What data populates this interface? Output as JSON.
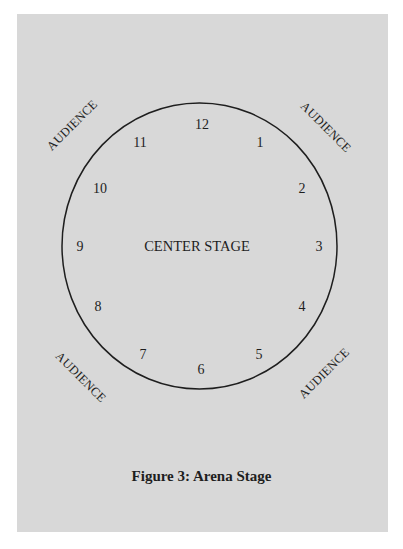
{
  "figure": {
    "caption": "Figure 3: Arena Stage",
    "center_label": "CENTER STAGE",
    "audience_label": "AUDIENCE",
    "colors": {
      "page_background": "#ffffff",
      "panel_background": "#d8d8d8",
      "ink": "#1e1e1e"
    },
    "positions": [
      {
        "label": "12",
        "x": 202,
        "y": 129
      },
      {
        "label": "1",
        "x": 260,
        "y": 147
      },
      {
        "label": "2",
        "x": 302,
        "y": 193
      },
      {
        "label": "3",
        "x": 319,
        "y": 251
      },
      {
        "label": "4",
        "x": 302,
        "y": 311
      },
      {
        "label": "5",
        "x": 259,
        "y": 359
      },
      {
        "label": "6",
        "x": 201,
        "y": 374
      },
      {
        "label": "7",
        "x": 143,
        "y": 359
      },
      {
        "label": "8",
        "x": 98,
        "y": 311
      },
      {
        "label": "9",
        "x": 80,
        "y": 251
      },
      {
        "label": "10",
        "x": 100,
        "y": 193
      },
      {
        "label": "11",
        "x": 140,
        "y": 147
      }
    ],
    "audience_areas": [
      {
        "corner": "top-left",
        "label": "AUDIENCE"
      },
      {
        "corner": "top-right",
        "label": "AUDIENCE"
      },
      {
        "corner": "bottom-left",
        "label": "AUDIENCE"
      },
      {
        "corner": "bottom-right",
        "label": "AUDIENCE"
      }
    ]
  }
}
